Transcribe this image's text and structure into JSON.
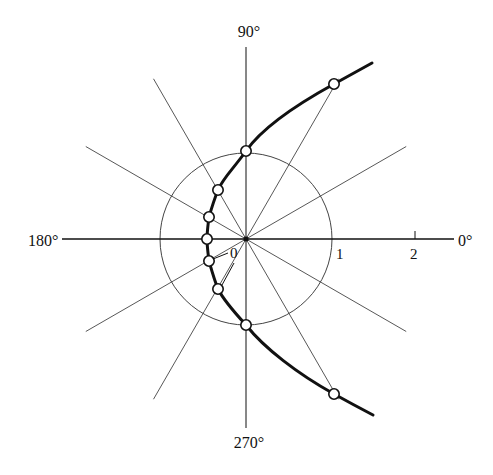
{
  "diagram": {
    "type": "polar-plot",
    "center": [
      246,
      239
    ],
    "scale_px_per_unit": 86,
    "colors": {
      "ink": "#111111",
      "thin_line": "#444444",
      "background": "#ffffff"
    },
    "angle_labels": [
      {
        "id": "deg-90",
        "text": "90°",
        "x": 249,
        "y": 37,
        "anchor": "middle"
      },
      {
        "id": "deg-180",
        "text": "180°",
        "x": 28,
        "y": 246,
        "anchor": "start"
      },
      {
        "id": "deg-0",
        "text": "0°",
        "x": 458,
        "y": 246,
        "anchor": "start"
      },
      {
        "id": "deg-270",
        "text": "270°",
        "x": 249,
        "y": 448,
        "anchor": "middle"
      }
    ],
    "radius_labels": [
      {
        "id": "r-0",
        "text": "0",
        "x": 234,
        "y": 259
      },
      {
        "id": "r-1",
        "text": "1",
        "x": 339,
        "y": 259
      },
      {
        "id": "r-2",
        "text": "2",
        "x": 415,
        "y": 259
      }
    ],
    "axes": {
      "horizontal": {
        "x1": 62,
        "y1": 239,
        "x2": 454,
        "y2": 239
      },
      "vertical": {
        "x1": 246,
        "y1": 47,
        "x2": 246,
        "y2": 428
      },
      "tick_2": {
        "x": 415,
        "y1": 231,
        "y2": 239
      }
    },
    "radial_lines_deg": [
      30,
      60,
      120,
      150,
      210,
      240,
      300,
      330
    ],
    "radial_line_length_px": 185,
    "unit_circle_radius_px": 86,
    "curve_points": [
      {
        "angle": 60,
        "x": 334,
        "y": 84
      },
      {
        "angle": 90,
        "x": 246,
        "y": 151
      },
      {
        "angle": 120,
        "x": 218,
        "y": 190
      },
      {
        "angle": 150,
        "x": 209,
        "y": 217
      },
      {
        "angle": 180,
        "x": 207,
        "y": 239
      },
      {
        "angle": 210,
        "x": 209,
        "y": 261
      },
      {
        "angle": 240,
        "x": 218,
        "y": 289
      },
      {
        "angle": 270,
        "x": 246,
        "y": 325
      },
      {
        "angle": 300,
        "x": 334,
        "y": 394
      }
    ],
    "curve_path": "M372,63 Q352,74 334,84 C294,106 262,128 246,151 C234,168 223,178 218,190 C214,200 211,210 209,217 C208,225 207,232 207,239 C207,246 208,253 209,261 C211,268 214,279 218,289 C224,301 235,313 246,325 C264,348 298,374 334,394 Q352,404 373,415",
    "zero_leader": {
      "x1": 213,
      "y1": 259,
      "x2": 228,
      "y2": 253
    },
    "zero_leader_2": {
      "x1": 222,
      "y1": 285,
      "x2": 234,
      "y2": 263
    }
  }
}
